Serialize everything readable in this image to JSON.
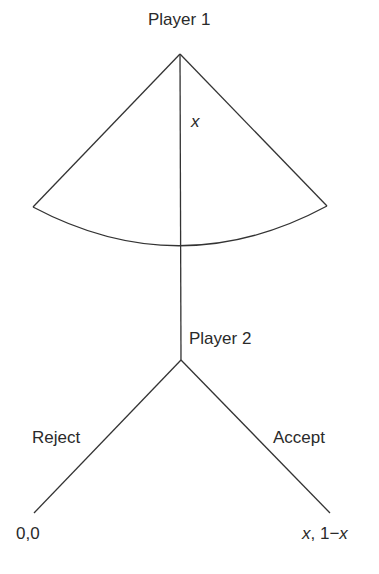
{
  "diagram": {
    "type": "game-tree",
    "line_color": "#333333",
    "nodes": {
      "player1": {
        "label": "Player 1"
      },
      "offer": {
        "label": "x"
      },
      "player2": {
        "label": "Player 2"
      }
    },
    "branches": {
      "reject": {
        "label": "Reject",
        "payoff": "0,0"
      },
      "accept": {
        "label": "Accept",
        "payoff_x": "x",
        "payoff_sep": ", 1−",
        "payoff_x2": "x"
      }
    }
  }
}
